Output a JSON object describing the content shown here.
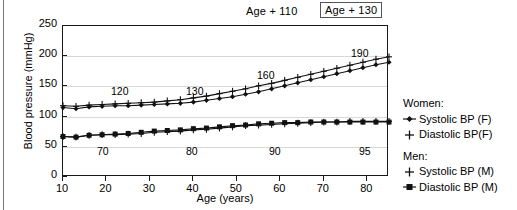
{
  "chart_data": {
    "type": "line",
    "title": "",
    "xlabel": "Age (years)",
    "ylabel": "Blood pressure (mmHg)",
    "xlim": [
      10,
      85
    ],
    "ylim": [
      0,
      250
    ],
    "yticks": [
      0,
      50,
      100,
      150,
      200,
      250
    ],
    "xticks": [
      10,
      20,
      30,
      40,
      50,
      60,
      70,
      80
    ],
    "grid": true,
    "legend_position": "right",
    "x": [
      10,
      13,
      16,
      19,
      22,
      25,
      28,
      31,
      34,
      37,
      40,
      43,
      46,
      49,
      52,
      55,
      58,
      61,
      64,
      67,
      70,
      73,
      76,
      79,
      82,
      85
    ],
    "series": [
      {
        "name": "Systolic BP (F)",
        "group": "Women",
        "marker": "diamond",
        "values": [
          115,
          113,
          116,
          117,
          118,
          118,
          119,
          120,
          121,
          122,
          124,
          127,
          130,
          133,
          137,
          141,
          146,
          151,
          156,
          161,
          166,
          171,
          176,
          181,
          186,
          190
        ]
      },
      {
        "name": "Diastolic BP(F)",
        "group": "Women",
        "marker": "plus",
        "values": [
          67,
          66,
          69,
          70,
          70,
          71,
          72,
          74,
          75,
          76,
          78,
          79,
          81,
          83,
          85,
          86,
          87,
          88,
          89,
          90,
          91,
          91,
          92,
          92,
          92,
          92
        ]
      },
      {
        "name": "Systolic BP (M)",
        "group": "Men",
        "marker": "cross",
        "values": [
          118,
          117,
          119,
          120,
          121,
          122,
          123,
          124,
          126,
          128,
          131,
          134,
          138,
          142,
          146,
          151,
          155,
          160,
          165,
          170,
          175,
          180,
          185,
          190,
          195,
          199
        ]
      },
      {
        "name": "Diastolic BP (M)",
        "group": "Men",
        "marker": "square",
        "values": [
          67,
          66,
          69,
          70,
          71,
          72,
          74,
          76,
          77,
          78,
          80,
          81,
          83,
          85,
          86,
          88,
          89,
          90,
          90,
          91,
          91,
          91,
          91,
          91,
          91,
          91
        ]
      }
    ],
    "annotations": [
      {
        "text": "120",
        "x_px": 110,
        "y_px": 84
      },
      {
        "text": "130",
        "x_px": 185,
        "y_px": 84
      },
      {
        "text": "160",
        "x_px": 256,
        "y_px": 68
      },
      {
        "text": "190",
        "x_px": 350,
        "y_px": 46
      },
      {
        "text": "70",
        "x_px": 96,
        "y_px": 144
      },
      {
        "text": "80",
        "x_px": 185,
        "y_px": 144
      },
      {
        "text": "90",
        "x_px": 268,
        "y_px": 144
      },
      {
        "text": "95",
        "x_px": 358,
        "y_px": 144
      }
    ]
  },
  "top_annotations": {
    "age_110": "Age + 110",
    "age_130": "Age + 130"
  },
  "legend": {
    "groups": [
      {
        "heading": "Women:",
        "entries": [
          {
            "label": "Systolic BP (F)",
            "marker": "diamond-line"
          },
          {
            "label": "Diastolic BP(F)",
            "marker": "plus"
          }
        ]
      },
      {
        "heading": "Men:",
        "entries": [
          {
            "label": "Systolic BP (M)",
            "marker": "cross"
          },
          {
            "label": "Diastolic BP (M)",
            "marker": "square-line"
          }
        ]
      }
    ]
  },
  "colors": {
    "line": "#111111",
    "grid": "#d8d8d8",
    "frame": "#1a1a1a",
    "background": "#ffffff"
  }
}
